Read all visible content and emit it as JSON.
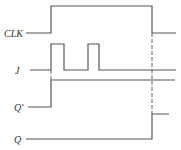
{
  "diagram": {
    "type": "timing-diagram",
    "colors": {
      "stroke": "#555555",
      "dash": "#666666",
      "label": "#333333",
      "background": "#ffffff"
    },
    "signals": [
      {
        "name": "CLK",
        "label": "CLK",
        "label_x": 4,
        "label_y": 37,
        "points": "26,33 51,33 51,6 152,6 152,33 176,33"
      },
      {
        "name": "J",
        "label": "J",
        "label_x": 15,
        "label_y": 74,
        "points": "30,70 51,70 51,44 64,44 64,70 88,70 88,44 99,44 99,70 176,70"
      },
      {
        "name": "Q_prime",
        "label": "Q'",
        "label_x": 14,
        "label_y": 111,
        "points": "28,107 51,107 51,80 175,80"
      },
      {
        "name": "Q",
        "label": "Q",
        "label_x": 14,
        "label_y": 143,
        "points": "26,139 152,139 152,114 169,114"
      }
    ],
    "guides": [
      {
        "name": "clk-rise-guide",
        "x1": 51,
        "y1": 70,
        "x2": 51,
        "y2": 80
      },
      {
        "name": "clk-fall-guide",
        "x1": 152,
        "y1": 33,
        "x2": 152,
        "y2": 114
      }
    ]
  }
}
